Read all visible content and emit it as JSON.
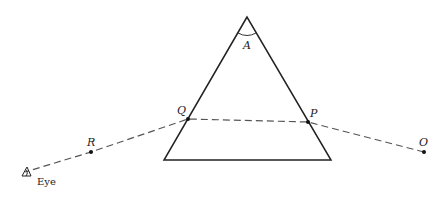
{
  "diagram": {
    "labels": {
      "apex_angle": "A",
      "point_q": "Q",
      "point_p": "P",
      "point_r": "R",
      "point_o": "O",
      "eye": "Eye"
    },
    "prism": {
      "apex": [
        247,
        17
      ],
      "base_left": [
        164,
        160
      ],
      "base_right": [
        331,
        160
      ]
    },
    "ray_points": {
      "O": [
        424,
        152
      ],
      "P": [
        308,
        122
      ],
      "Q": [
        188,
        119
      ],
      "R": [
        91,
        152
      ],
      "Eye": [
        25,
        172
      ]
    },
    "colors": {
      "line": "#222222",
      "dashed_ray": "#555555"
    }
  }
}
